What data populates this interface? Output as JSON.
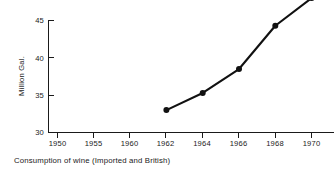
{
  "chart_data": {
    "type": "line",
    "title": "",
    "caption": "Consumption of wine (Imported and British)",
    "xlabel": "",
    "ylabel": "Million Gal.",
    "x_tick_labels": [
      "1950",
      "1955",
      "1960",
      "1962",
      "1964",
      "1966",
      "1968",
      "1970"
    ],
    "y_tick_labels": [
      "30",
      "35",
      "40",
      "45"
    ],
    "y_ticks": [
      30,
      35,
      40,
      45
    ],
    "ylim": [
      30,
      47.5
    ],
    "grid": false,
    "legend": false,
    "legend_position": "none",
    "note": "x-axis categories are evenly spaced although year intervals differ (5-year then 2-year steps); data begins at 1962",
    "categories": [
      "1950",
      "1955",
      "1960",
      "1962",
      "1964",
      "1966",
      "1968",
      "1970"
    ],
    "values": [
      null,
      null,
      null,
      33.0,
      35.3,
      38.5,
      44.3,
      48.0
    ],
    "series": [
      {
        "name": "Consumption of wine",
        "points": [
          {
            "x": "1962",
            "y": 33.0
          },
          {
            "x": "1964",
            "y": 35.3
          },
          {
            "x": "1966",
            "y": 38.5
          },
          {
            "x": "1968",
            "y": 44.3
          },
          {
            "x": "1970",
            "y": 48.0
          }
        ]
      }
    ],
    "colors": {
      "line": "#111111",
      "marker": "#111111",
      "axis": "#1a1a1a",
      "background": "#ffffff"
    }
  },
  "axis": {
    "y_title": "Million Gal.",
    "y_labels": {
      "t0": "30",
      "t1": "35",
      "t2": "40",
      "t3": "45"
    },
    "x_labels": {
      "t0": "1950",
      "t1": "1955",
      "t2": "1960",
      "t3": "1962",
      "t4": "1964",
      "t5": "1966",
      "t6": "1968",
      "t7": "1970"
    }
  },
  "caption": {
    "text": "Consumption of wine (Imported and British)"
  }
}
